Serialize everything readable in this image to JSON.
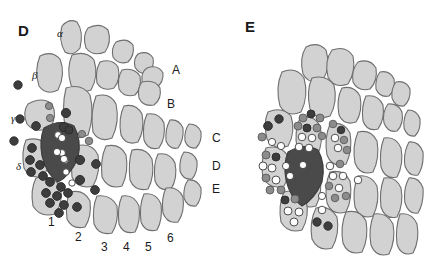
{
  "figure": {
    "background_color": "#ffffff",
    "width": 424,
    "height": 263,
    "type": "scientific-diagram"
  },
  "colors": {
    "cell_fill": "#d2d2d2",
    "cell_stroke": "#6e6e6e",
    "dark_cell_fill": "#4a4a4a",
    "dark_cell_stroke": "#3a3a3a",
    "dot_dark": "#3d3d3d",
    "dot_mid": "#8c8c8c",
    "dot_light": "#ffffff",
    "text": "#1a1a1a"
  },
  "panels": [
    {
      "id": "D",
      "label": "D",
      "label_x": 18,
      "label_y": 22,
      "row_labels": [
        {
          "text": "A",
          "x": 172,
          "y": 63
        },
        {
          "text": "B",
          "x": 167,
          "y": 97
        },
        {
          "text": "C",
          "x": 212,
          "y": 131
        },
        {
          "text": "D",
          "x": 212,
          "y": 159
        },
        {
          "text": "E",
          "x": 212,
          "y": 182
        }
      ],
      "greek_labels": [
        {
          "text": "α",
          "x": 57,
          "y": 27
        },
        {
          "text": "β",
          "x": 32,
          "y": 69
        },
        {
          "text": "γ",
          "x": 11,
          "y": 112
        },
        {
          "text": "δ",
          "x": 16,
          "y": 160
        }
      ],
      "arc_labels": [
        {
          "text": "1",
          "x": 48,
          "y": 215
        },
        {
          "text": "2",
          "x": 75,
          "y": 230
        },
        {
          "text": "3",
          "x": 101,
          "y": 240
        },
        {
          "text": "4",
          "x": 123,
          "y": 240
        },
        {
          "text": "5",
          "x": 145,
          "y": 240
        },
        {
          "text": "6",
          "x": 167,
          "y": 231
        }
      ]
    },
    {
      "id": "E",
      "label": "E",
      "label_x": 245,
      "label_y": 18,
      "row_labels": [],
      "greek_labels": [],
      "arc_labels": []
    }
  ],
  "panelD": {
    "cells": [
      {
        "d": "M62,26 Q69,18 77,22 Q84,32 80,48 Q73,57 65,52 Q58,40 62,26 Z"
      },
      {
        "d": "M88,28 Q100,22 108,30 Q112,42 105,52 Q93,57 86,48 Q82,36 88,28 Z"
      },
      {
        "d": "M116,42 Q127,37 133,45 Q135,55 128,62 Q118,65 113,57 Q111,48 116,42 Z"
      },
      {
        "d": "M138,54 Q148,50 153,58 Q155,67 148,73 Q139,75 135,67 Q133,59 138,54 Z"
      },
      {
        "d": "M147,68 Q158,64 163,73 Q164,82 156,88 Q146,89 142,81 Q141,72 147,68 Z"
      },
      {
        "d": "M40,56 Q52,50 60,59 Q66,74 58,90 Q46,96 39,86 Q34,70 40,56 Z"
      },
      {
        "d": "M72,55 Q86,50 94,60 Q99,76 91,90 Q78,95 71,85 Q66,69 72,55 Z"
      },
      {
        "d": "M100,62 Q112,58 118,67 Q121,80 114,88 Q102,92 97,83 Q95,71 100,62 Z"
      },
      {
        "d": "M122,70 Q134,67 140,76 Q142,88 135,95 Q124,98 119,89 Q117,78 122,70 Z"
      },
      {
        "d": "M142,82 Q155,79 160,88 Q162,99 154,105 Q143,107 139,98 Q137,88 142,82 Z"
      },
      {
        "d": "M28,104 Q42,96 52,104 Q58,116 50,128 Q35,134 27,124 Q22,112 28,104 Z"
      },
      {
        "d": "M66,88 Q82,83 90,95 Q95,115 88,135 Q74,142 66,131 Q61,108 66,88 Z"
      },
      {
        "d": "M96,96 Q110,92 116,104 Q120,122 112,138 Q99,143 93,132 Q90,112 96,96 Z"
      },
      {
        "d": "M124,106 Q136,103 142,114 Q145,130 138,142 Q126,146 121,135 Q118,118 124,106 Z"
      },
      {
        "d": "M147,114 Q159,112 164,123 Q166,138 159,148 Q148,151 144,140 Q142,125 147,114 Z"
      },
      {
        "d": "M170,120 Q179,119 183,128 Q184,140 178,148 Q170,150 166,141 Q165,129 170,120 Z"
      },
      {
        "d": "M189,124 Q198,124 201,132 Q202,142 196,148 Q188,149 185,141 Q184,130 189,124 Z"
      },
      {
        "d": "M26,140 Q40,136 48,146 Q52,162 44,176 Q30,180 24,168 Q21,152 26,140 Z"
      },
      {
        "d": "M76,146 Q92,142 98,155 Q101,172 93,186 Q78,190 72,177 Q70,159 76,146 Z"
      },
      {
        "d": "M106,146 Q120,143 126,155 Q129,172 122,186 Q108,190 102,177 Q100,159 106,146 Z"
      },
      {
        "d": "M132,150 Q146,147 152,159 Q155,176 148,189 Q135,192 130,180 Q128,162 132,150 Z"
      },
      {
        "d": "M158,154 Q170,152 175,163 Q178,178 171,189 Q159,192 155,181 Q153,164 158,154 Z"
      },
      {
        "d": "M184,152 Q194,152 197,161 Q198,172 192,179 Q183,180 180,171 Q179,159 184,152 Z"
      },
      {
        "d": "M36,178 Q52,174 60,186 Q64,202 55,214 Q40,218 33,206 Q30,190 36,178 Z"
      },
      {
        "d": "M70,192 Q84,189 90,201 Q92,216 85,227 Q72,230 67,219 Q65,203 70,192 Z"
      },
      {
        "d": "M97,196 Q111,194 117,206 Q119,222 112,233 Q99,236 94,224 Q92,207 97,196 Z"
      },
      {
        "d": "M122,196 Q134,194 139,206 Q141,221 135,232 Q123,235 119,224 Q117,207 122,196 Z"
      },
      {
        "d": "M144,194 Q156,192 161,204 Q163,219 157,230 Q145,233 141,222 Q139,205 144,194 Z"
      },
      {
        "d": "M166,188 Q178,186 183,197 Q185,212 178,222 Q167,224 163,213 Q161,198 166,188 Z"
      },
      {
        "d": "M188,180 Q197,179 201,188 Q202,199 196,206 Q187,207 184,198 Q183,187 188,180 Z"
      }
    ],
    "dark_cell": {
      "d": "M44,128 Q60,118 74,126 Q82,140 78,158 Q70,176 58,182 Q46,174 42,156 Q39,140 44,128 Z"
    },
    "dots": [
      {
        "cx": 18,
        "cy": 85,
        "r": 4.2,
        "tone": "dark"
      },
      {
        "cx": 49,
        "cy": 106,
        "r": 3.6,
        "tone": "mid"
      },
      {
        "cx": 50,
        "cy": 118,
        "r": 3.6,
        "tone": "mid"
      },
      {
        "cx": 20,
        "cy": 119,
        "r": 4.2,
        "tone": "dark"
      },
      {
        "cx": 36,
        "cy": 126,
        "r": 4.4,
        "tone": "dark"
      },
      {
        "cx": 14,
        "cy": 141,
        "r": 4.2,
        "tone": "dark"
      },
      {
        "cx": 66,
        "cy": 113,
        "r": 4.6,
        "tone": "dark"
      },
      {
        "cx": 64,
        "cy": 127,
        "r": 4.6,
        "tone": "dark"
      },
      {
        "cx": 69,
        "cy": 130,
        "r": 4.0,
        "tone": "dark"
      },
      {
        "cx": 82,
        "cy": 134,
        "r": 3.6,
        "tone": "mid"
      },
      {
        "cx": 89,
        "cy": 141,
        "r": 3.8,
        "tone": "mid"
      },
      {
        "cx": 58,
        "cy": 135,
        "r": 3.4,
        "tone": "light"
      },
      {
        "cx": 62,
        "cy": 153,
        "r": 3.4,
        "tone": "light"
      },
      {
        "cx": 65,
        "cy": 160,
        "r": 3.4,
        "tone": "light"
      },
      {
        "cx": 66,
        "cy": 172,
        "r": 3.2,
        "tone": "light"
      },
      {
        "cx": 72,
        "cy": 183,
        "r": 3.2,
        "tone": "light"
      },
      {
        "cx": 32,
        "cy": 148,
        "r": 4.4,
        "tone": "dark"
      },
      {
        "cx": 30,
        "cy": 160,
        "r": 4.4,
        "tone": "dark"
      },
      {
        "cx": 40,
        "cy": 165,
        "r": 4.4,
        "tone": "dark"
      },
      {
        "cx": 31,
        "cy": 172,
        "r": 4.4,
        "tone": "dark"
      },
      {
        "cx": 43,
        "cy": 176,
        "r": 4.4,
        "tone": "dark"
      },
      {
        "cx": 80,
        "cy": 160,
        "r": 4.6,
        "tone": "dark"
      },
      {
        "cx": 96,
        "cy": 164,
        "r": 4.4,
        "tone": "dark"
      },
      {
        "cx": 80,
        "cy": 180,
        "r": 4.6,
        "tone": "dark"
      },
      {
        "cx": 95,
        "cy": 190,
        "r": 4.4,
        "tone": "dark"
      },
      {
        "cx": 50,
        "cy": 182,
        "r": 4.4,
        "tone": "dark"
      },
      {
        "cx": 61,
        "cy": 187,
        "r": 4.4,
        "tone": "dark"
      },
      {
        "cx": 46,
        "cy": 193,
        "r": 4.4,
        "tone": "dark"
      },
      {
        "cx": 57,
        "cy": 196,
        "r": 4.4,
        "tone": "dark"
      },
      {
        "cx": 68,
        "cy": 193,
        "r": 4.4,
        "tone": "dark"
      },
      {
        "cx": 50,
        "cy": 203,
        "r": 4.4,
        "tone": "dark"
      },
      {
        "cx": 64,
        "cy": 205,
        "r": 4.4,
        "tone": "dark"
      },
      {
        "cx": 59,
        "cy": 213,
        "r": 4.4,
        "tone": "dark"
      },
      {
        "cx": 77,
        "cy": 207,
        "r": 4.4,
        "tone": "dark"
      }
    ],
    "dark_cell_dots": [
      {
        "cx": 62,
        "cy": 138,
        "r": 3.6,
        "tone": "light"
      },
      {
        "cx": 57,
        "cy": 152,
        "r": 3.6,
        "tone": "light"
      },
      {
        "cx": 64,
        "cy": 159,
        "r": 3.6,
        "tone": "light"
      }
    ]
  },
  "panelE": {
    "cells": [
      {
        "d": "M306,47 Q318,41 326,50 Q331,66 323,80 Q310,86 303,74 Q299,58 306,47 Z"
      },
      {
        "d": "M332,50 Q346,45 353,56 Q356,72 348,84 Q334,89 328,77 Q324,61 332,50 Z"
      },
      {
        "d": "M358,62 Q370,58 376,68 Q378,81 370,89 Q358,92 353,82 Q351,70 358,62 Z"
      },
      {
        "d": "M380,72 Q390,70 394,79 Q396,90 389,96 Q380,98 376,89 Q375,78 380,72 Z"
      },
      {
        "d": "M396,82 Q406,80 410,89 Q411,100 404,106 Q395,107 392,98 Q391,88 396,82 Z"
      },
      {
        "d": "M282,72 Q296,66 304,78 Q309,96 301,112 Q287,118 280,106 Q275,87 282,72 Z"
      },
      {
        "d": "M312,78 Q326,74 334,85 Q338,102 330,116 Q316,121 310,109 Q306,91 312,78 Z"
      },
      {
        "d": "M342,88 Q354,85 360,96 Q363,111 356,122 Q344,126 339,115 Q336,99 342,88 Z"
      },
      {
        "d": "M366,96 Q378,94 383,105 Q385,119 378,129 Q367,132 363,121 Q361,106 366,96 Z"
      },
      {
        "d": "M388,104 Q398,103 402,112 Q404,124 397,131 Q388,133 384,123 Q382,112 388,104 Z"
      },
      {
        "d": "M408,110 Q417,110 420,119 Q421,130 415,136 Q407,137 404,128 Q403,117 408,110 Z"
      },
      {
        "d": "M268,112 Q282,106 291,116 Q296,132 288,146 Q274,151 267,139 Q263,123 268,112 Z"
      },
      {
        "d": "M300,118 Q314,114 320,126 Q324,142 317,156 Q303,160 297,148 Q294,131 300,118 Z"
      },
      {
        "d": "M330,124 Q344,121 350,133 Q353,150 346,164 Q332,168 327,155 Q324,138 330,124 Z"
      },
      {
        "d": "M358,132 Q371,129 377,141 Q380,158 373,172 Q360,176 355,163 Q352,146 358,132 Z"
      },
      {
        "d": "M384,138 Q396,136 401,148 Q404,164 397,177 Q385,180 381,167 Q379,151 384,138 Z"
      },
      {
        "d": "M409,142 Q419,141 423,152 Q424,166 418,175 Q409,177 405,166 Q403,153 409,142 Z"
      },
      {
        "d": "M266,148 Q280,144 288,156 Q292,172 284,186 Q270,190 263,178 Q260,161 266,148 Z"
      },
      {
        "d": "M300,166 Q314,163 320,175 Q323,192 316,206 Q302,210 297,197 Q294,180 300,166 Z"
      },
      {
        "d": "M330,172 Q344,169 350,181 Q353,198 346,212 Q332,216 327,203 Q324,186 330,172 Z"
      },
      {
        "d": "M358,176 Q371,174 377,186 Q380,202 373,216 Q360,220 355,207 Q352,190 358,176 Z"
      },
      {
        "d": "M384,178 Q396,176 401,188 Q404,204 397,217 Q385,220 381,207 Q379,191 384,178 Z"
      },
      {
        "d": "M409,178 Q419,177 423,188 Q424,203 418,213 Q409,215 405,203 Q403,189 409,178 Z"
      },
      {
        "d": "M284,192 Q298,188 306,200 Q310,216 302,230 Q288,234 281,222 Q278,205 284,192 Z"
      },
      {
        "d": "M316,208 Q330,205 337,217 Q340,234 332,248 Q318,252 312,239 Q309,222 316,208 Z"
      },
      {
        "d": "M346,212 Q360,209 366,221 Q369,238 362,252 Q348,256 343,243 Q340,226 346,212 Z"
      },
      {
        "d": "M374,214 Q387,212 393,224 Q396,240 389,254 Q376,258 371,245 Q368,228 374,214 Z"
      },
      {
        "d": "M400,214 Q412,212 417,224 Q420,240 413,253 Q401,257 397,244 Q395,228 400,214 Z"
      }
    ],
    "dark_cell": {
      "d": "M288,152 Q304,142 318,150 Q326,164 322,182 Q314,200 302,206 Q290,198 286,180 Q283,164 288,152 Z"
    },
    "dots": [
      {
        "cx": 268,
        "cy": 126,
        "r": 4.4,
        "tone": "dark"
      },
      {
        "cx": 279,
        "cy": 119,
        "r": 4.2,
        "tone": "dark"
      },
      {
        "cx": 262,
        "cy": 137,
        "r": 4.0,
        "tone": "mid"
      },
      {
        "cx": 272,
        "cy": 142,
        "r": 3.6,
        "tone": "light"
      },
      {
        "cx": 281,
        "cy": 146,
        "r": 3.6,
        "tone": "light"
      },
      {
        "cx": 303,
        "cy": 118,
        "r": 4.0,
        "tone": "mid"
      },
      {
        "cx": 311,
        "cy": 114,
        "r": 4.0,
        "tone": "dark"
      },
      {
        "cx": 320,
        "cy": 118,
        "r": 4.0,
        "tone": "mid"
      },
      {
        "cx": 298,
        "cy": 126,
        "r": 4.0,
        "tone": "mid"
      },
      {
        "cx": 307,
        "cy": 128,
        "r": 4.0,
        "tone": "dark"
      },
      {
        "cx": 317,
        "cy": 128,
        "r": 4.0,
        "tone": "mid"
      },
      {
        "cx": 302,
        "cy": 137,
        "r": 3.8,
        "tone": "light"
      },
      {
        "cx": 312,
        "cy": 138,
        "r": 3.8,
        "tone": "light"
      },
      {
        "cx": 322,
        "cy": 136,
        "r": 3.8,
        "tone": "mid"
      },
      {
        "cx": 299,
        "cy": 147,
        "r": 3.8,
        "tone": "light"
      },
      {
        "cx": 309,
        "cy": 148,
        "r": 3.8,
        "tone": "light"
      },
      {
        "cx": 333,
        "cy": 124,
        "r": 3.8,
        "tone": "mid"
      },
      {
        "cx": 341,
        "cy": 130,
        "r": 3.8,
        "tone": "dark"
      },
      {
        "cx": 335,
        "cy": 138,
        "r": 3.8,
        "tone": "light"
      },
      {
        "cx": 344,
        "cy": 140,
        "r": 3.8,
        "tone": "mid"
      },
      {
        "cx": 338,
        "cy": 148,
        "r": 3.8,
        "tone": "light"
      },
      {
        "cx": 347,
        "cy": 150,
        "r": 3.8,
        "tone": "mid"
      },
      {
        "cx": 266,
        "cy": 155,
        "r": 4.0,
        "tone": "mid"
      },
      {
        "cx": 276,
        "cy": 157,
        "r": 4.0,
        "tone": "dark"
      },
      {
        "cx": 263,
        "cy": 166,
        "r": 4.0,
        "tone": "light"
      },
      {
        "cx": 272,
        "cy": 168,
        "r": 4.0,
        "tone": "light"
      },
      {
        "cx": 266,
        "cy": 178,
        "r": 4.0,
        "tone": "mid"
      },
      {
        "cx": 276,
        "cy": 180,
        "r": 4.0,
        "tone": "light"
      },
      {
        "cx": 270,
        "cy": 190,
        "r": 4.0,
        "tone": "mid"
      },
      {
        "cx": 281,
        "cy": 190,
        "r": 4.0,
        "tone": "mid"
      },
      {
        "cx": 286,
        "cy": 166,
        "r": 3.6,
        "tone": "light"
      },
      {
        "cx": 290,
        "cy": 176,
        "r": 3.6,
        "tone": "light"
      },
      {
        "cx": 330,
        "cy": 166,
        "r": 3.8,
        "tone": "light"
      },
      {
        "cx": 340,
        "cy": 164,
        "r": 3.8,
        "tone": "mid"
      },
      {
        "cx": 333,
        "cy": 176,
        "r": 3.8,
        "tone": "light"
      },
      {
        "cx": 343,
        "cy": 176,
        "r": 3.8,
        "tone": "light"
      },
      {
        "cx": 329,
        "cy": 186,
        "r": 3.8,
        "tone": "mid"
      },
      {
        "cx": 339,
        "cy": 188,
        "r": 3.8,
        "tone": "light"
      },
      {
        "cx": 335,
        "cy": 198,
        "r": 3.8,
        "tone": "mid"
      },
      {
        "cx": 346,
        "cy": 196,
        "r": 3.8,
        "tone": "mid"
      },
      {
        "cx": 322,
        "cy": 196,
        "r": 3.6,
        "tone": "light"
      },
      {
        "cx": 358,
        "cy": 180,
        "r": 3.8,
        "tone": "light"
      },
      {
        "cx": 285,
        "cy": 200,
        "r": 4.0,
        "tone": "dark"
      },
      {
        "cx": 295,
        "cy": 199,
        "r": 4.0,
        "tone": "mid"
      },
      {
        "cx": 288,
        "cy": 211,
        "r": 4.0,
        "tone": "light"
      },
      {
        "cx": 299,
        "cy": 212,
        "r": 4.0,
        "tone": "light"
      },
      {
        "cx": 294,
        "cy": 222,
        "r": 4.0,
        "tone": "light"
      },
      {
        "cx": 317,
        "cy": 222,
        "r": 4.2,
        "tone": "dark"
      },
      {
        "cx": 328,
        "cy": 226,
        "r": 4.2,
        "tone": "dark"
      },
      {
        "cx": 322,
        "cy": 210,
        "r": 3.8,
        "tone": "light"
      }
    ],
    "dark_cell_dots": [
      {
        "cx": 303,
        "cy": 165,
        "r": 3.6,
        "tone": "light"
      }
    ]
  }
}
